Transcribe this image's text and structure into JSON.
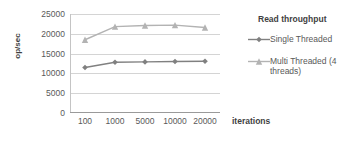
{
  "chart_data": {
    "type": "line",
    "title": "",
    "legend_title": "Read throughput",
    "legend_position": "right",
    "xlabel": "iterations",
    "ylabel": "op/sec",
    "categories": [
      "100",
      "1000",
      "5000",
      "10000",
      "20000"
    ],
    "ylim": [
      0,
      25000
    ],
    "yticks": [
      "0",
      "5000",
      "10000",
      "15000",
      "20000",
      "25000"
    ],
    "ytick_values": [
      0,
      5000,
      10000,
      15000,
      20000,
      25000
    ],
    "grid": true,
    "series": [
      {
        "name": "Single Threaded",
        "values": [
          11500,
          12800,
          12900,
          13000,
          13050
        ],
        "color": "#808080",
        "marker": "diamond"
      },
      {
        "name": "Multi Threaded (4 threads)",
        "values": [
          18500,
          21800,
          22100,
          22200,
          21600
        ],
        "color": "#b3b3b3",
        "marker": "triangle"
      }
    ]
  }
}
